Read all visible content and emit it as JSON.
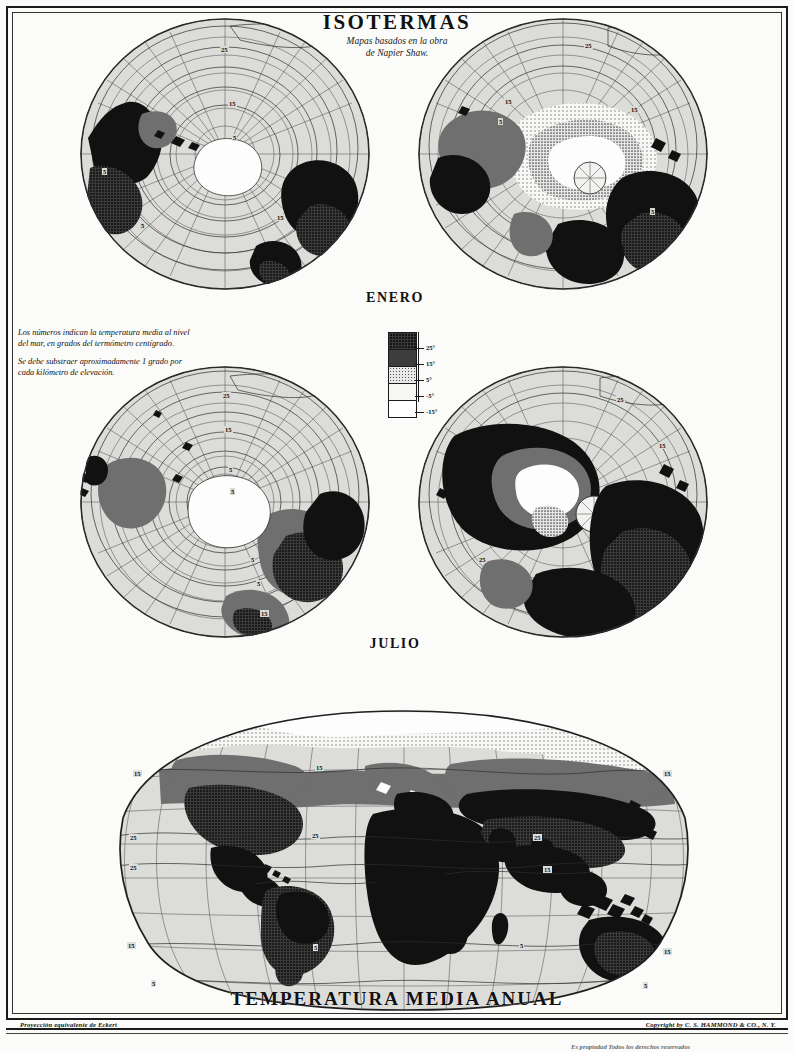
{
  "page": {
    "title": "ISOTERMAS",
    "subtitle_line1": "Mapas basados en  la obra",
    "subtitle_line2": "de Napier Shaw.",
    "proj_credit": "Proyección equivalente de Eckert",
    "copyright": "Copyright by C. S. HAMMOND & CO., N. Y.",
    "rights": "Es propiedad Todos los derechos reservados",
    "paper_color": "#fbfbf9",
    "ink_color": "#111111",
    "ocean_color": "#d9d9d6"
  },
  "note": {
    "paragraph1": "Los números  indican  la temperatura media al nivel del mar, en grados del termómetro centígrado.",
    "paragraph2": "Se debe substraer aproximadamente 1 grado por cada kilómetro de elevación."
  },
  "legend": {
    "name": "temperature-band-legend",
    "unit": "°",
    "bands": [
      {
        "label": "25",
        "pattern": "dense-black-crosshatch",
        "swatch": "#111111"
      },
      {
        "label": "15",
        "pattern": "solid-dark-gray",
        "swatch": "#3d3d3d"
      },
      {
        "label": "5",
        "pattern": "medium-dots",
        "swatch": "#c9c9c9"
      },
      {
        "label": "-5",
        "pattern": "light-dots",
        "swatch": "#ececec"
      },
      {
        "label": "-15",
        "pattern": "white-blank",
        "swatch": "#ffffff"
      }
    ]
  },
  "maps": [
    {
      "id": "enero-sur",
      "label": "",
      "caption_shared": "ENERO",
      "projection": "polar-azimuthal",
      "pole": "Antarctic / South Polar",
      "isotherm_labels": [
        "25",
        "15",
        "5",
        "-5",
        "-15"
      ]
    },
    {
      "id": "enero-norte",
      "label": "",
      "caption_shared": "ENERO",
      "projection": "polar-azimuthal",
      "pole": "Arctic / North Polar",
      "isotherm_labels": [
        "25",
        "15",
        "5"
      ]
    },
    {
      "id": "julio-sur",
      "label": "",
      "caption_shared": "JULIO",
      "projection": "polar-azimuthal",
      "pole": "Antarctic / South Polar",
      "isotherm_labels": [
        "25",
        "15",
        "5",
        "-5",
        "-15"
      ]
    },
    {
      "id": "julio-norte",
      "label": "",
      "caption_shared": "JULIO",
      "projection": "polar-azimuthal",
      "pole": "Arctic / North Polar",
      "isotherm_labels": [
        "25",
        "15"
      ]
    }
  ],
  "captions": {
    "map_january": "ENERO",
    "map_july": "JULIO",
    "map_annual": "TEMPERATURA MEDIA ANUAL"
  },
  "world_map": {
    "id": "temperatura-media-anual",
    "projection": "Eckert equal-area",
    "isotherm_labels": [
      "15",
      "25",
      "25",
      "15",
      "15",
      "5",
      "25",
      "15",
      "25",
      "15",
      "5"
    ]
  }
}
